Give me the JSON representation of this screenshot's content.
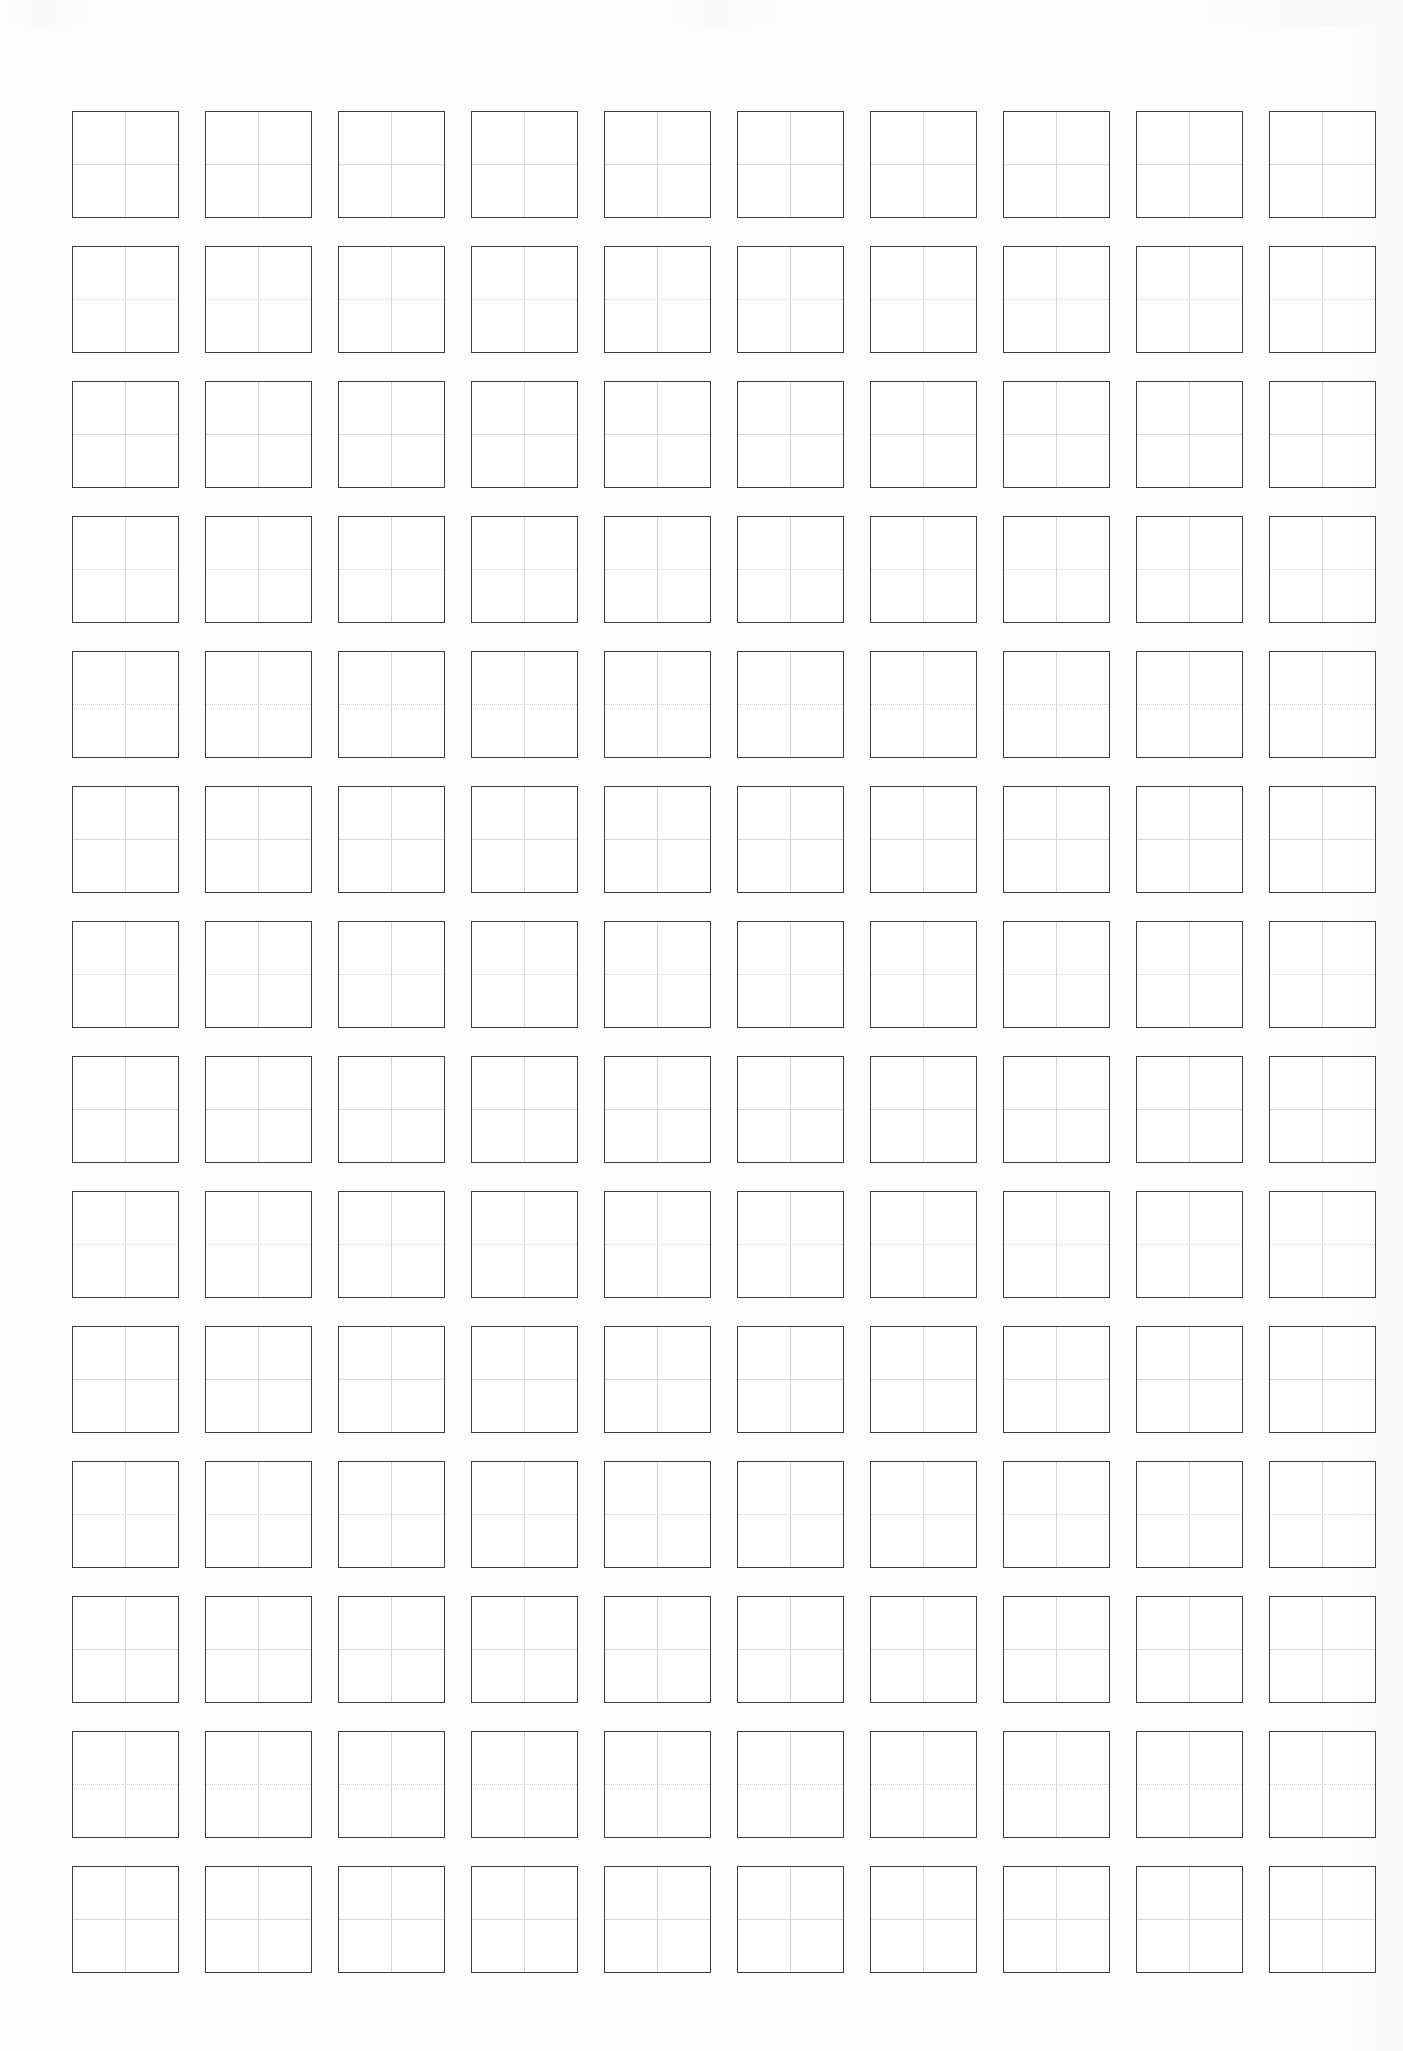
{
  "sheet": {
    "title": "Chinese character practice grid sheet",
    "paper_color": "#fdfdfd",
    "cell_background": "#ffffff",
    "cell_border_color": "#3c3c3c",
    "guide_line_color": "#d4d4d4"
  },
  "grid": {
    "columns": 10,
    "rows": 14,
    "total_cells": 140,
    "cell_width_px": 107,
    "cell_height_px": 107,
    "column_gap_px": 26,
    "row_gap_px": 28,
    "origin_x_px": 72,
    "origin_y_px": 111,
    "cell_type": "tianzige-four-quadrant",
    "guides_per_cell": 2,
    "cell_content": ""
  },
  "cells": [
    {
      "row": 1,
      "col": 1,
      "text": ""
    },
    {
      "row": 1,
      "col": 2,
      "text": ""
    },
    {
      "row": 1,
      "col": 3,
      "text": ""
    },
    {
      "row": 1,
      "col": 4,
      "text": ""
    },
    {
      "row": 1,
      "col": 5,
      "text": ""
    },
    {
      "row": 1,
      "col": 6,
      "text": ""
    },
    {
      "row": 1,
      "col": 7,
      "text": ""
    },
    {
      "row": 1,
      "col": 8,
      "text": ""
    },
    {
      "row": 1,
      "col": 9,
      "text": ""
    },
    {
      "row": 1,
      "col": 10,
      "text": ""
    },
    {
      "row": 2,
      "col": 1,
      "text": ""
    },
    {
      "row": 2,
      "col": 2,
      "text": ""
    },
    {
      "row": 2,
      "col": 3,
      "text": ""
    },
    {
      "row": 2,
      "col": 4,
      "text": ""
    },
    {
      "row": 2,
      "col": 5,
      "text": ""
    },
    {
      "row": 2,
      "col": 6,
      "text": ""
    },
    {
      "row": 2,
      "col": 7,
      "text": ""
    },
    {
      "row": 2,
      "col": 8,
      "text": ""
    },
    {
      "row": 2,
      "col": 9,
      "text": ""
    },
    {
      "row": 2,
      "col": 10,
      "text": ""
    },
    {
      "row": 3,
      "col": 1,
      "text": ""
    },
    {
      "row": 3,
      "col": 2,
      "text": ""
    },
    {
      "row": 3,
      "col": 3,
      "text": ""
    },
    {
      "row": 3,
      "col": 4,
      "text": ""
    },
    {
      "row": 3,
      "col": 5,
      "text": ""
    },
    {
      "row": 3,
      "col": 6,
      "text": ""
    },
    {
      "row": 3,
      "col": 7,
      "text": ""
    },
    {
      "row": 3,
      "col": 8,
      "text": ""
    },
    {
      "row": 3,
      "col": 9,
      "text": ""
    },
    {
      "row": 3,
      "col": 10,
      "text": ""
    },
    {
      "row": 4,
      "col": 1,
      "text": ""
    },
    {
      "row": 4,
      "col": 2,
      "text": ""
    },
    {
      "row": 4,
      "col": 3,
      "text": ""
    },
    {
      "row": 4,
      "col": 4,
      "text": ""
    },
    {
      "row": 4,
      "col": 5,
      "text": ""
    },
    {
      "row": 4,
      "col": 6,
      "text": ""
    },
    {
      "row": 4,
      "col": 7,
      "text": ""
    },
    {
      "row": 4,
      "col": 8,
      "text": ""
    },
    {
      "row": 4,
      "col": 9,
      "text": ""
    },
    {
      "row": 4,
      "col": 10,
      "text": ""
    },
    {
      "row": 5,
      "col": 1,
      "text": ""
    },
    {
      "row": 5,
      "col": 2,
      "text": ""
    },
    {
      "row": 5,
      "col": 3,
      "text": ""
    },
    {
      "row": 5,
      "col": 4,
      "text": ""
    },
    {
      "row": 5,
      "col": 5,
      "text": ""
    },
    {
      "row": 5,
      "col": 6,
      "text": ""
    },
    {
      "row": 5,
      "col": 7,
      "text": ""
    },
    {
      "row": 5,
      "col": 8,
      "text": ""
    },
    {
      "row": 5,
      "col": 9,
      "text": ""
    },
    {
      "row": 5,
      "col": 10,
      "text": ""
    },
    {
      "row": 6,
      "col": 1,
      "text": ""
    },
    {
      "row": 6,
      "col": 2,
      "text": ""
    },
    {
      "row": 6,
      "col": 3,
      "text": ""
    },
    {
      "row": 6,
      "col": 4,
      "text": ""
    },
    {
      "row": 6,
      "col": 5,
      "text": ""
    },
    {
      "row": 6,
      "col": 6,
      "text": ""
    },
    {
      "row": 6,
      "col": 7,
      "text": ""
    },
    {
      "row": 6,
      "col": 8,
      "text": ""
    },
    {
      "row": 6,
      "col": 9,
      "text": ""
    },
    {
      "row": 6,
      "col": 10,
      "text": ""
    },
    {
      "row": 7,
      "col": 1,
      "text": ""
    },
    {
      "row": 7,
      "col": 2,
      "text": ""
    },
    {
      "row": 7,
      "col": 3,
      "text": ""
    },
    {
      "row": 7,
      "col": 4,
      "text": ""
    },
    {
      "row": 7,
      "col": 5,
      "text": ""
    },
    {
      "row": 7,
      "col": 6,
      "text": ""
    },
    {
      "row": 7,
      "col": 7,
      "text": ""
    },
    {
      "row": 7,
      "col": 8,
      "text": ""
    },
    {
      "row": 7,
      "col": 9,
      "text": ""
    },
    {
      "row": 7,
      "col": 10,
      "text": ""
    },
    {
      "row": 8,
      "col": 1,
      "text": ""
    },
    {
      "row": 8,
      "col": 2,
      "text": ""
    },
    {
      "row": 8,
      "col": 3,
      "text": ""
    },
    {
      "row": 8,
      "col": 4,
      "text": ""
    },
    {
      "row": 8,
      "col": 5,
      "text": ""
    },
    {
      "row": 8,
      "col": 6,
      "text": ""
    },
    {
      "row": 8,
      "col": 7,
      "text": ""
    },
    {
      "row": 8,
      "col": 8,
      "text": ""
    },
    {
      "row": 8,
      "col": 9,
      "text": ""
    },
    {
      "row": 8,
      "col": 10,
      "text": ""
    },
    {
      "row": 9,
      "col": 1,
      "text": ""
    },
    {
      "row": 9,
      "col": 2,
      "text": ""
    },
    {
      "row": 9,
      "col": 3,
      "text": ""
    },
    {
      "row": 9,
      "col": 4,
      "text": ""
    },
    {
      "row": 9,
      "col": 5,
      "text": ""
    },
    {
      "row": 9,
      "col": 6,
      "text": ""
    },
    {
      "row": 9,
      "col": 7,
      "text": ""
    },
    {
      "row": 9,
      "col": 8,
      "text": ""
    },
    {
      "row": 9,
      "col": 9,
      "text": ""
    },
    {
      "row": 9,
      "col": 10,
      "text": ""
    },
    {
      "row": 10,
      "col": 1,
      "text": ""
    },
    {
      "row": 10,
      "col": 2,
      "text": ""
    },
    {
      "row": 10,
      "col": 3,
      "text": ""
    },
    {
      "row": 10,
      "col": 4,
      "text": ""
    },
    {
      "row": 10,
      "col": 5,
      "text": ""
    },
    {
      "row": 10,
      "col": 6,
      "text": ""
    },
    {
      "row": 10,
      "col": 7,
      "text": ""
    },
    {
      "row": 10,
      "col": 8,
      "text": ""
    },
    {
      "row": 10,
      "col": 9,
      "text": ""
    },
    {
      "row": 10,
      "col": 10,
      "text": ""
    },
    {
      "row": 11,
      "col": 1,
      "text": ""
    },
    {
      "row": 11,
      "col": 2,
      "text": ""
    },
    {
      "row": 11,
      "col": 3,
      "text": ""
    },
    {
      "row": 11,
      "col": 4,
      "text": ""
    },
    {
      "row": 11,
      "col": 5,
      "text": ""
    },
    {
      "row": 11,
      "col": 6,
      "text": ""
    },
    {
      "row": 11,
      "col": 7,
      "text": ""
    },
    {
      "row": 11,
      "col": 8,
      "text": ""
    },
    {
      "row": 11,
      "col": 9,
      "text": ""
    },
    {
      "row": 11,
      "col": 10,
      "text": ""
    },
    {
      "row": 12,
      "col": 1,
      "text": ""
    },
    {
      "row": 12,
      "col": 2,
      "text": ""
    },
    {
      "row": 12,
      "col": 3,
      "text": ""
    },
    {
      "row": 12,
      "col": 4,
      "text": ""
    },
    {
      "row": 12,
      "col": 5,
      "text": ""
    },
    {
      "row": 12,
      "col": 6,
      "text": ""
    },
    {
      "row": 12,
      "col": 7,
      "text": ""
    },
    {
      "row": 12,
      "col": 8,
      "text": ""
    },
    {
      "row": 12,
      "col": 9,
      "text": ""
    },
    {
      "row": 12,
      "col": 10,
      "text": ""
    },
    {
      "row": 13,
      "col": 1,
      "text": ""
    },
    {
      "row": 13,
      "col": 2,
      "text": ""
    },
    {
      "row": 13,
      "col": 3,
      "text": ""
    },
    {
      "row": 13,
      "col": 4,
      "text": ""
    },
    {
      "row": 13,
      "col": 5,
      "text": ""
    },
    {
      "row": 13,
      "col": 6,
      "text": ""
    },
    {
      "row": 13,
      "col": 7,
      "text": ""
    },
    {
      "row": 13,
      "col": 8,
      "text": ""
    },
    {
      "row": 13,
      "col": 9,
      "text": ""
    },
    {
      "row": 13,
      "col": 10,
      "text": ""
    },
    {
      "row": 14,
      "col": 1,
      "text": ""
    },
    {
      "row": 14,
      "col": 2,
      "text": ""
    },
    {
      "row": 14,
      "col": 3,
      "text": ""
    },
    {
      "row": 14,
      "col": 4,
      "text": ""
    },
    {
      "row": 14,
      "col": 5,
      "text": ""
    },
    {
      "row": 14,
      "col": 6,
      "text": ""
    },
    {
      "row": 14,
      "col": 7,
      "text": ""
    },
    {
      "row": 14,
      "col": 8,
      "text": ""
    },
    {
      "row": 14,
      "col": 9,
      "text": ""
    },
    {
      "row": 14,
      "col": 10,
      "text": ""
    }
  ],
  "dotted_rule_rows": [
    2,
    4,
    5,
    7,
    9,
    11,
    13
  ]
}
